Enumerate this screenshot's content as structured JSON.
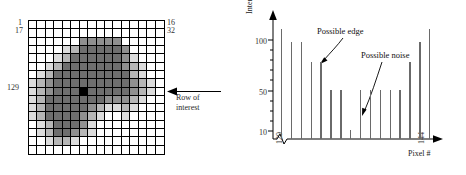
{
  "figure": {
    "left_panel": {
      "name": "pixel-intensity-grid",
      "corner_labels": {
        "top_left_row": "1",
        "top_left_col": "17",
        "top_right_row": "16",
        "top_right_col": "32",
        "row_of_interest": "129"
      },
      "annotation": {
        "text": "Row of interest",
        "line1": "Row of",
        "line2": "interest"
      },
      "grid": {
        "rows": 16,
        "cols": 16,
        "levels": [
          "white",
          "light",
          "mid-light",
          "mid",
          "dark",
          "black"
        ],
        "level_colors": [
          "#ffffff",
          "#dcdcdc",
          "#b6b6b6",
          "#909090",
          "#6e6e6e",
          "#000000"
        ],
        "cells": [
          [
            0,
            0,
            0,
            0,
            0,
            0,
            0,
            0,
            0,
            0,
            0,
            0,
            0,
            0,
            0,
            0
          ],
          [
            0,
            0,
            0,
            0,
            0,
            0,
            0,
            0,
            0,
            0,
            0,
            0,
            0,
            0,
            0,
            0
          ],
          [
            0,
            0,
            0,
            0,
            0,
            0,
            3,
            3,
            3,
            3,
            3,
            0,
            0,
            0,
            0,
            0
          ],
          [
            0,
            0,
            0,
            0,
            1,
            2,
            4,
            4,
            4,
            4,
            4,
            3,
            0,
            0,
            0,
            0
          ],
          [
            0,
            0,
            0,
            1,
            2,
            4,
            4,
            4,
            4,
            4,
            4,
            3,
            1,
            0,
            0,
            0
          ],
          [
            0,
            0,
            1,
            2,
            4,
            4,
            4,
            4,
            4,
            4,
            4,
            3,
            2,
            1,
            0,
            0
          ],
          [
            0,
            1,
            2,
            4,
            4,
            4,
            4,
            4,
            4,
            4,
            4,
            4,
            2,
            1,
            0,
            0
          ],
          [
            1,
            2,
            3,
            4,
            4,
            4,
            4,
            4,
            4,
            4,
            4,
            4,
            3,
            2,
            1,
            0
          ],
          [
            1,
            2,
            3,
            4,
            4,
            4,
            5,
            4,
            4,
            4,
            4,
            4,
            3,
            2,
            1,
            0
          ],
          [
            1,
            2,
            4,
            4,
            4,
            4,
            4,
            4,
            4,
            3,
            3,
            3,
            2,
            1,
            0,
            0
          ],
          [
            1,
            2,
            4,
            4,
            4,
            4,
            4,
            3,
            2,
            1,
            1,
            2,
            1,
            0,
            0,
            0
          ],
          [
            1,
            2,
            4,
            4,
            4,
            4,
            3,
            2,
            1,
            0,
            0,
            1,
            0,
            0,
            0,
            0
          ],
          [
            0,
            1,
            2,
            4,
            4,
            4,
            3,
            1,
            0,
            0,
            0,
            0,
            0,
            0,
            0,
            0
          ],
          [
            0,
            1,
            2,
            4,
            4,
            3,
            2,
            1,
            0,
            0,
            0,
            0,
            0,
            0,
            0,
            0
          ],
          [
            0,
            0,
            1,
            2,
            2,
            1,
            0,
            0,
            0,
            0,
            0,
            0,
            0,
            0,
            0,
            0
          ],
          [
            0,
            0,
            0,
            0,
            0,
            0,
            0,
            0,
            0,
            0,
            0,
            0,
            0,
            0,
            0,
            0
          ]
        ]
      }
    },
    "right_panel": {
      "name": "row-intensity-profile"
    }
  },
  "chart_data": {
    "type": "bar",
    "title": "",
    "xlabel": "Pixel #",
    "ylabel": "Intensity",
    "ylim": [
      0,
      110
    ],
    "xlim": [
      129,
      144
    ],
    "grid": false,
    "legend": null,
    "axis_break_x": true,
    "ytick_labels": [
      "100",
      "50",
      "10"
    ],
    "ytick_values": [
      100,
      50,
      10
    ],
    "xtick_labels": [
      "129",
      "144"
    ],
    "categories": [
      129,
      130,
      131,
      132,
      133,
      134,
      135,
      136,
      137,
      138,
      139,
      140,
      141,
      142,
      143,
      144
    ],
    "values": [
      100,
      88,
      88,
      70,
      70,
      45,
      45,
      8,
      45,
      45,
      45,
      45,
      45,
      70,
      88,
      100
    ],
    "annotations": [
      {
        "text": "Possible edge",
        "points_to_pixel": 133
      },
      {
        "text": "Possible noise",
        "points_to_pixel": 136
      }
    ]
  }
}
